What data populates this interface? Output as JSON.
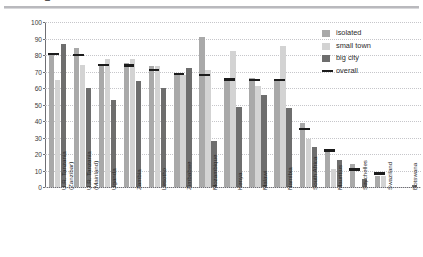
{
  "title_cut": "Figure: Percentage of students with access to a school library, by geographical location",
  "legend": {
    "position": "top-right",
    "items": [
      {
        "key": "isolated",
        "label": "isolated",
        "color": "#a9a9a9"
      },
      {
        "key": "small_town",
        "label": "small town",
        "color": "#d3d3d3"
      },
      {
        "key": "big_city",
        "label": "big city",
        "color": "#6e6e6e"
      },
      {
        "key": "overall",
        "label": "overall",
        "color": "#1c1c1c"
      }
    ]
  },
  "chart_data": {
    "type": "bar",
    "title": "",
    "xlabel": "",
    "ylabel": "Percentage of students with\naccess to a school library",
    "ylim": [
      0,
      100
    ],
    "yticks": [
      0,
      10,
      20,
      30,
      40,
      50,
      60,
      70,
      80,
      90,
      100
    ],
    "grid": true,
    "grid_style": "dotted-horizontal",
    "legend_position": "top-right",
    "categories": [
      "U.R. Tanzania\n(Zanzibar)",
      "U.R. Tanzania\n(Mainland)",
      "Uganda",
      "Zambia",
      "Lesotho",
      "Zimbabwe",
      "Mozambique",
      "Kenya",
      "Malawi",
      "Namibia",
      "South Africa",
      "Mauritius",
      "Seychelles",
      "Swaziland",
      "Botswana"
    ],
    "series": [
      {
        "name": "isolated",
        "color": "#a9a9a9",
        "values": [
          81,
          84.5,
          74,
          75,
          73.5,
          68.5,
          91,
          65,
          66,
          65.5,
          38.5,
          22,
          14,
          6.5,
          0
        ]
      },
      {
        "name": "small town",
        "color": "#d3d3d3",
        "values": [
          65,
          74,
          77.5,
          77.5,
          73.5,
          68,
          71,
          82.5,
          61,
          85.5,
          29,
          11,
          0,
          6.5,
          0
        ]
      },
      {
        "name": "big city",
        "color": "#6e6e6e",
        "values": [
          86.5,
          60,
          53,
          64,
          60,
          72,
          28,
          48.5,
          55.5,
          48,
          24,
          16.5,
          5,
          0,
          1
        ]
      },
      {
        "name": "overall",
        "color": "#1c1c1c",
        "type": "marker-line",
        "values": [
          80,
          79.5,
          73.5,
          73,
          70.5,
          68,
          67,
          64.5,
          64,
          64,
          34.5,
          21.5,
          10,
          7.5,
          0
        ]
      }
    ]
  }
}
